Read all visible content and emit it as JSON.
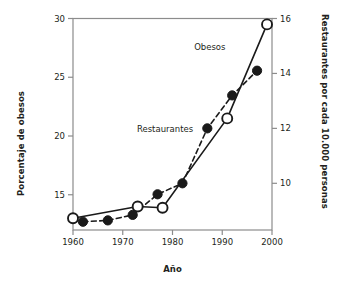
{
  "chart_data": {
    "type": "line",
    "title": "",
    "xlabel": "Año",
    "ylabel": "Porcentaje de obesos",
    "y2label": "Restaurantes por cada 10.000 personas",
    "xlim": [
      1960,
      2000
    ],
    "ylim": [
      12.0,
      30.0
    ],
    "y2lim": [
      8.3,
      16.0
    ],
    "grid": false,
    "legend": "inline-annotations",
    "xticks": [
      1960,
      1970,
      1980,
      1990,
      2000
    ],
    "xticklabels": [
      "1960",
      "1970",
      "1980",
      "1990",
      "2000"
    ],
    "yticks": [
      15,
      20,
      25,
      30
    ],
    "yticklabels": [
      "15",
      "20",
      "25",
      "30"
    ],
    "y2ticks": [
      10,
      12,
      14,
      16
    ],
    "y2ticklabels": [
      "10",
      "12",
      "14",
      "16"
    ],
    "series": [
      {
        "name": "Obesos",
        "axis": "left",
        "marker": "open-circle",
        "linestyle": "solid",
        "color": "#1a1a1a",
        "x": [
          1960,
          1973,
          1978,
          1991,
          1999
        ],
        "values": [
          13.0,
          14.0,
          13.9,
          21.5,
          29.5
        ]
      },
      {
        "name": "Restaurantes",
        "axis": "right",
        "marker": "filled-circle",
        "linestyle": "dashed",
        "color": "#1a1a1a",
        "x": [
          1962,
          1967,
          1972,
          1977,
          1982,
          1987,
          1992,
          1997
        ],
        "values": [
          8.6,
          8.65,
          8.85,
          9.6,
          10.0,
          12.0,
          13.2,
          14.1
        ]
      }
    ],
    "annotations": [
      {
        "text": "Obesos",
        "x": 1987.5,
        "y_axis": "left",
        "y": 27.6
      },
      {
        "text": "Restaurantes",
        "x": 1978.5,
        "y_axis": "left",
        "y": 20.6
      }
    ]
  }
}
